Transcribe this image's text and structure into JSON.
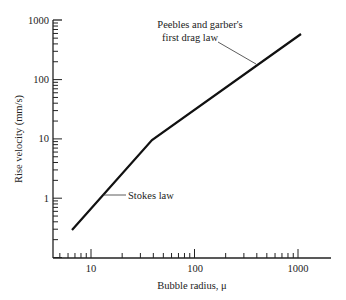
{
  "chart_data": {
    "type": "line",
    "title": "",
    "xlabel": "Bubble radius, μ",
    "ylabel": "Rise velocity (mm/s)",
    "xscale": "log",
    "yscale": "log",
    "xlim": [
      4.3,
      2000
    ],
    "ylim": [
      0.1,
      1000
    ],
    "xticks": [
      "10",
      "100",
      "1000"
    ],
    "yticks": [
      "1",
      "10",
      "100",
      "1000"
    ],
    "grid": false,
    "series": [
      {
        "name": "Rise velocity",
        "x": [
          6.5,
          39,
          1070
        ],
        "y": [
          0.29,
          10,
          580
        ]
      }
    ],
    "annotations": [
      {
        "text": "Stokes law",
        "x": 13,
        "y": 1.1
      },
      {
        "text": "Peebles and garber's first drag law",
        "x": 420,
        "y": 170
      }
    ]
  },
  "labels": {
    "xlabel": "Bubble radius, μ",
    "ylabel": "Rise velocity (mm/s)",
    "stokes": "Stokes law",
    "peebles_line1": "Peebles and garber's",
    "peebles_line2": "first drag law",
    "x10": "10",
    "x100": "100",
    "x1000": "1000",
    "y1": "1",
    "y10": "10",
    "y100": "100",
    "y1000": "1000"
  }
}
